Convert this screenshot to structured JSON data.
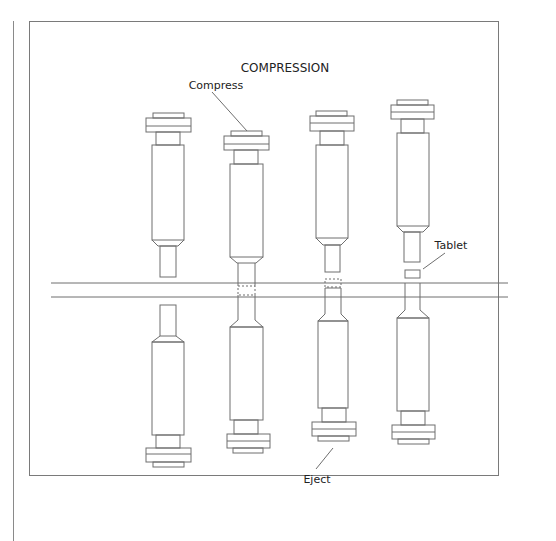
{
  "diagram": {
    "title": "COMPRESSION",
    "labels": {
      "compress": "Compress",
      "tablet": "Tablet",
      "eject": "Eject"
    },
    "stages": [
      {
        "id": "stage-1",
        "description": "Upper punch raised, lower punch in die (filling)"
      },
      {
        "id": "stage-2",
        "description": "Upper punch compresses into die"
      },
      {
        "id": "stage-3",
        "description": "Upper punch rising, lower punch pushes tablet up"
      },
      {
        "id": "stage-4",
        "description": "Tablet ejected above die table"
      }
    ],
    "colors": {
      "line": "#6e6e6e",
      "frame": "#7a7a7a",
      "text": "#222222"
    }
  }
}
